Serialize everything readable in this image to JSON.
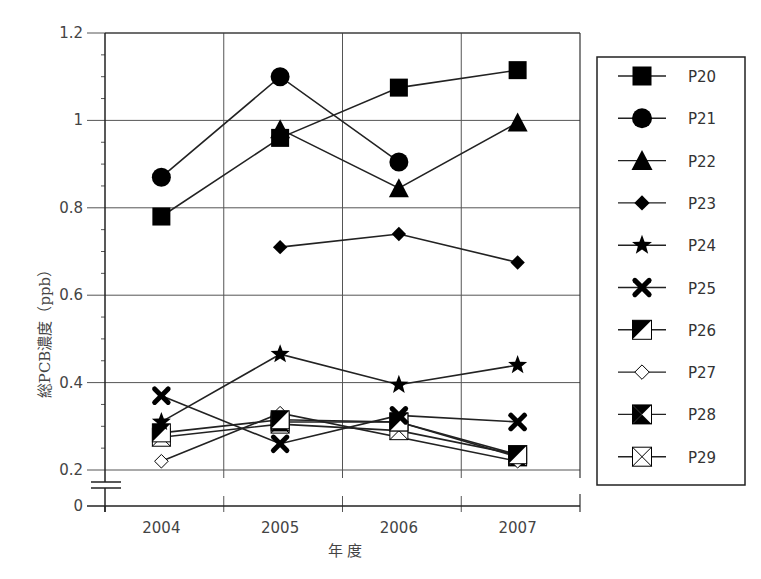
{
  "chart_data": {
    "type": "line",
    "title": "",
    "xlabel": "年 度",
    "ylabel": "総PCB濃度（ppb）",
    "categories": [
      "2004",
      "2005",
      "2006",
      "2007"
    ],
    "ylim": [
      0,
      1.2
    ],
    "axis_break": {
      "from": 0,
      "to": 0.2
    },
    "yticks": [
      "0",
      "0.2",
      "0.4",
      "0.6",
      "0.8",
      "1",
      "1.2"
    ],
    "grid": true,
    "legend_position": "right",
    "series": [
      {
        "name": "P20",
        "marker": "filled-square",
        "values": [
          0.78,
          0.96,
          1.075,
          1.115
        ]
      },
      {
        "name": "P21",
        "marker": "filled-circle",
        "values": [
          0.87,
          1.1,
          0.905,
          null
        ]
      },
      {
        "name": "P22",
        "marker": "filled-triangle",
        "values": [
          null,
          0.98,
          0.845,
          0.995
        ]
      },
      {
        "name": "P23",
        "marker": "filled-diamond",
        "values": [
          null,
          0.71,
          0.74,
          0.675
        ]
      },
      {
        "name": "P24",
        "marker": "filled-star",
        "values": [
          0.31,
          0.465,
          0.395,
          0.44
        ]
      },
      {
        "name": "P25",
        "marker": "bold-x",
        "values": [
          0.37,
          0.26,
          0.325,
          0.31
        ]
      },
      {
        "name": "P26",
        "marker": "half-filled-square",
        "values": [
          0.285,
          0.315,
          0.31,
          0.235
        ]
      },
      {
        "name": "P27",
        "marker": "open-diamond",
        "values": [
          0.22,
          0.33,
          null,
          0.22
        ]
      },
      {
        "name": "P28",
        "marker": "bowtie-square",
        "values": [
          null,
          0.31,
          0.31,
          0.23
        ]
      },
      {
        "name": "P29",
        "marker": "crossed-square",
        "values": [
          0.275,
          0.305,
          0.29,
          0.235
        ]
      }
    ]
  },
  "colors": {
    "marker": "#000000",
    "line": "#222222",
    "grid": "#555555",
    "text": "#444444"
  }
}
